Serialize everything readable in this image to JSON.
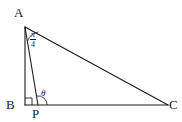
{
  "figure": {
    "type": "geometry-diagram",
    "background_color": "#ffffff",
    "stroke_color": "#1a1a1a",
    "vertices": [
      {
        "id": "A",
        "label": "A",
        "x": 25,
        "y": 27
      },
      {
        "id": "B",
        "label": "B",
        "x": 25,
        "y": 105
      },
      {
        "id": "P",
        "label": "P",
        "x": 38,
        "y": 105
      },
      {
        "id": "C",
        "label": "C",
        "x": 168,
        "y": 105
      }
    ],
    "segments": [
      {
        "id": "AB",
        "from": "A",
        "to": "B"
      },
      {
        "id": "BC",
        "from": "B",
        "to": "C"
      },
      {
        "id": "AC",
        "from": "A",
        "to": "C"
      },
      {
        "id": "AP",
        "from": "A",
        "to": "P"
      }
    ],
    "angles": [
      {
        "id": "angle-at-A",
        "at": "A",
        "between": [
          "AP",
          "AC"
        ],
        "label_numerator": "π",
        "label_denominator": "4",
        "label_text": "π/4",
        "marker": "arc"
      },
      {
        "id": "angle-at-P",
        "at": "P",
        "between": [
          "PA",
          "PC"
        ],
        "label_text": "θ",
        "marker": "arc"
      },
      {
        "id": "angle-at-B",
        "at": "B",
        "between": [
          "BA",
          "BC"
        ],
        "label_text": "",
        "marker": "right-angle-square"
      }
    ]
  }
}
